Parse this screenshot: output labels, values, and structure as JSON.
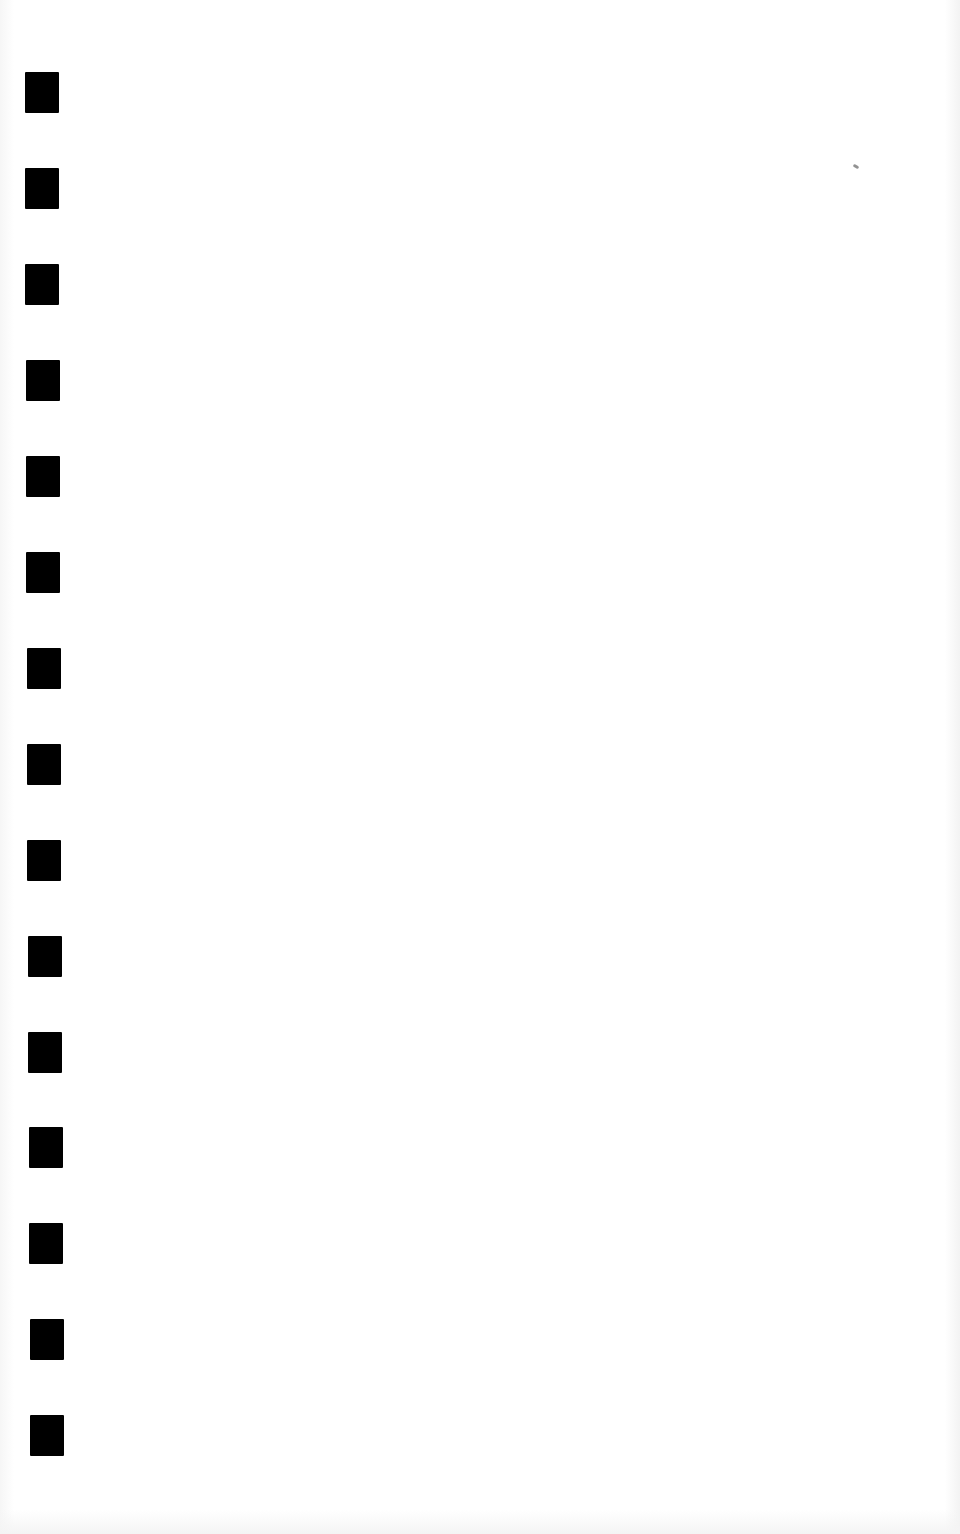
{
  "page": {
    "type": "blank scanned page",
    "background_color": "#ffffff",
    "text": ""
  },
  "margin_marks": {
    "count": 15,
    "color": "#000000",
    "width": 34,
    "height": 41,
    "items": [
      {
        "x": 25,
        "y": 72
      },
      {
        "x": 25,
        "y": 168
      },
      {
        "x": 25,
        "y": 264
      },
      {
        "x": 26,
        "y": 360
      },
      {
        "x": 26,
        "y": 456
      },
      {
        "x": 26,
        "y": 552
      },
      {
        "x": 27,
        "y": 648
      },
      {
        "x": 27,
        "y": 744
      },
      {
        "x": 27,
        "y": 840
      },
      {
        "x": 28,
        "y": 936
      },
      {
        "x": 28,
        "y": 1032
      },
      {
        "x": 29,
        "y": 1127
      },
      {
        "x": 29,
        "y": 1223
      },
      {
        "x": 30,
        "y": 1319
      },
      {
        "x": 30,
        "y": 1415
      }
    ]
  },
  "artifacts": [
    {
      "name": "scan-speck",
      "x": 853,
      "y": 165
    }
  ]
}
